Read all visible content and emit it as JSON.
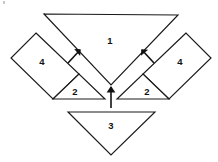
{
  "figure": {
    "canvas": {
      "width": 218,
      "height": 162
    },
    "background_color": "#ffffff",
    "stroke_color": "#1a1a1a",
    "label_color": "#111111",
    "pieces": [
      {
        "id": "piece-1",
        "label": "1",
        "shape": "triangle",
        "description": "large downward-pointing triangle at top",
        "points": "44,14 178,15 111,85",
        "label_x": 110,
        "label_y": 41
      },
      {
        "id": "piece-4-left",
        "label": "4",
        "shape": "parallelogram",
        "description": "tilted rectangle on the upper left",
        "points": "36,33 79,74 53,99 11,58",
        "label_x": 42,
        "label_y": 62
      },
      {
        "id": "piece-4-right",
        "label": "4",
        "shape": "parallelogram",
        "description": "tilted rectangle on the upper right",
        "points": "186,33 143,74 169,99 211,58",
        "label_x": 180,
        "label_y": 62
      },
      {
        "id": "piece-2-left",
        "label": "2",
        "shape": "triangle",
        "description": "small triangle left of center",
        "points": "53,99 105,99 79,74",
        "label_x": 75,
        "label_y": 92
      },
      {
        "id": "piece-2-right",
        "label": "2",
        "shape": "triangle",
        "description": "small triangle right of center",
        "points": "169,99 117,99 143,74",
        "label_x": 147,
        "label_y": 92
      },
      {
        "id": "piece-3",
        "label": "3",
        "shape": "triangle",
        "description": "downward-pointing triangle at bottom",
        "points": "68,112 155,112 111,155",
        "label_x": 111,
        "label_y": 126
      }
    ],
    "arrows": [
      {
        "id": "arrow-left",
        "direction": "up-right",
        "from_x": 68,
        "from_y": 63,
        "to_x": 80,
        "to_y": 50
      },
      {
        "id": "arrow-right",
        "direction": "up-left",
        "from_x": 154,
        "from_y": 63,
        "to_x": 142,
        "to_y": 50
      },
      {
        "id": "arrow-center",
        "direction": "up",
        "from_x": 111,
        "from_y": 108,
        "to_x": 111,
        "to_y": 87
      }
    ]
  }
}
